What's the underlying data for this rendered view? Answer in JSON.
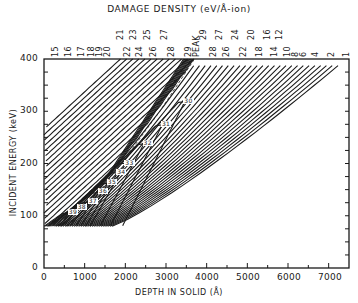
{
  "chart_data": {
    "type": "line",
    "subtype": "contour",
    "title": "DAMAGE DENSITY (eV/Å-ion)",
    "xlabel": "DEPTH IN SOLID (Å)",
    "ylabel": "INCIDENT ENERGY (keV)",
    "xlim": [
      0,
      7500
    ],
    "ylim": [
      0,
      400
    ],
    "x_ticks": [
      0,
      1000,
      2000,
      3000,
      4000,
      5000,
      6000,
      7000
    ],
    "x_tick_labels": [
      "0",
      "1000",
      "2000",
      "3000",
      "4000",
      "5000",
      "6000",
      "7000"
    ],
    "y_ticks": [
      0,
      100,
      200,
      300,
      400
    ],
    "y_tick_labels": [
      "0",
      "100",
      "200",
      "300",
      "400"
    ],
    "grid": false,
    "legend": null,
    "top_axis_labels_lower_row": [
      "15",
      "16",
      "17",
      "18",
      "19",
      "20",
      "22",
      "24",
      "26",
      "28",
      "29",
      "PEAK",
      "28",
      "26",
      "22",
      "18",
      "14",
      "10",
      "8",
      "6",
      "4",
      "2",
      "1"
    ],
    "top_axis_labels_upper_row": [
      "21",
      "23",
      "25",
      "27",
      "29",
      "27",
      "24",
      "20",
      "16",
      "12"
    ],
    "top_axis_label_positions_depth": {
      "15": 200,
      "16": 500,
      "17": 800,
      "18": 1050,
      "19": 1250,
      "20": 1450,
      "21": 1850,
      "22": 1850,
      "23": 2200,
      "24": 2200,
      "25": 2600,
      "26": 2600,
      "27": 3150,
      "28": 3150,
      "29": 3650,
      "PEAK": 3700,
      "29_right": 3800,
      "28_right": 4150,
      "27_right": 4450,
      "26_right": 4450,
      "24_right": 4950,
      "22_right": 4950,
      "20_right": 5350,
      "18_right": 5350,
      "16_right": 5800,
      "14_right": 5800,
      "12_right": 6100,
      "10_right": 6100,
      "8_right": 6350,
      "6_right": 6550,
      "4_right": 6850,
      "2_right": 7250,
      "1_right": 7480
    },
    "contour_levels": [
      1,
      2,
      4,
      6,
      8,
      10,
      12,
      14,
      15,
      16,
      17,
      18,
      19,
      20,
      21,
      22,
      23,
      24,
      25,
      26,
      27,
      28,
      29,
      30,
      31,
      32,
      33,
      34,
      35,
      36,
      37,
      38,
      39
    ],
    "interior_labels": [
      {
        "label": "30",
        "depth": 3400,
        "energy": 318
      },
      {
        "label": "31",
        "depth": 2850,
        "energy": 274
      },
      {
        "label": "32",
        "depth": 2400,
        "energy": 238
      },
      {
        "label": "33",
        "depth": 1950,
        "energy": 200
      },
      {
        "label": "34",
        "depth": 1750,
        "energy": 182
      },
      {
        "label": "35",
        "depth": 1520,
        "energy": 162
      },
      {
        "label": "36",
        "depth": 1300,
        "energy": 145
      },
      {
        "label": "37",
        "depth": 1050,
        "energy": 126
      },
      {
        "label": "38",
        "depth": 780,
        "energy": 115
      },
      {
        "label": "39",
        "depth": 560,
        "energy": 106
      }
    ],
    "peak_line": {
      "label": "PEAK",
      "style": "dashed",
      "points": [
        [
          900,
          100
        ],
        [
          1900,
          200
        ],
        [
          2850,
          300
        ],
        [
          3700,
          400
        ]
      ]
    },
    "contour_floor_energy_keV": 80
  }
}
